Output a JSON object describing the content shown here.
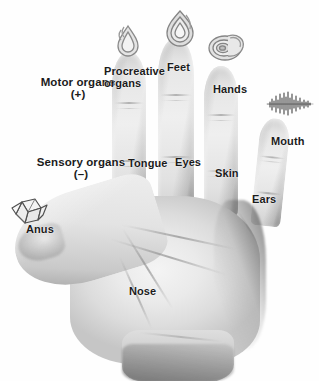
{
  "categories": [
    {
      "id": "motor",
      "name": "motor-organs-label",
      "label": "Motor organs",
      "sign": "(+)"
    },
    {
      "id": "sensory",
      "name": "sensory-organs-label",
      "label": "Sensory organs",
      "sign": "(–)"
    }
  ],
  "digit_labels": [
    {
      "id": "procreative",
      "label": "Procreative organs",
      "digit": "index-finger",
      "zone": "upper"
    },
    {
      "id": "feet",
      "label": "Feet",
      "digit": "middle-finger",
      "zone": "upper"
    },
    {
      "id": "hands",
      "label": "Hands",
      "digit": "ring-finger",
      "zone": "upper"
    },
    {
      "id": "mouth",
      "label": "Mouth",
      "digit": "little-finger",
      "zone": "upper"
    },
    {
      "id": "tongue",
      "label": "Tongue",
      "digit": "index-finger",
      "zone": "lower"
    },
    {
      "id": "eyes",
      "label": "Eyes",
      "digit": "middle-finger",
      "zone": "lower"
    },
    {
      "id": "skin",
      "label": "Skin",
      "digit": "ring-finger",
      "zone": "lower"
    },
    {
      "id": "ears",
      "label": "Ears",
      "digit": "little-finger",
      "zone": "lower"
    },
    {
      "id": "anus",
      "label": "Anus",
      "digit": "thumb",
      "zone": "tip"
    },
    {
      "id": "nose",
      "label": "Nose",
      "digit": "palm",
      "zone": "center"
    }
  ],
  "icons": [
    {
      "id": "procreative-icon",
      "name": "flame-drop-icon",
      "above": "index-finger"
    },
    {
      "id": "feet-icon",
      "name": "flame-icon",
      "above": "middle-finger"
    },
    {
      "id": "hands-icon",
      "name": "spiral-shell-icon",
      "above": "ring-finger"
    },
    {
      "id": "mouth-icon",
      "name": "sound-wave-icon",
      "above": "little-finger"
    },
    {
      "id": "anus-icon",
      "name": "diamond-crystal-icon",
      "above": "thumb"
    }
  ],
  "colors": {
    "background": "#ffffff",
    "label_text": "#1b1b1b",
    "skin_light": "#efefef",
    "skin_mid": "#d2d2d2",
    "skin_dark": "#9b9b9b"
  }
}
